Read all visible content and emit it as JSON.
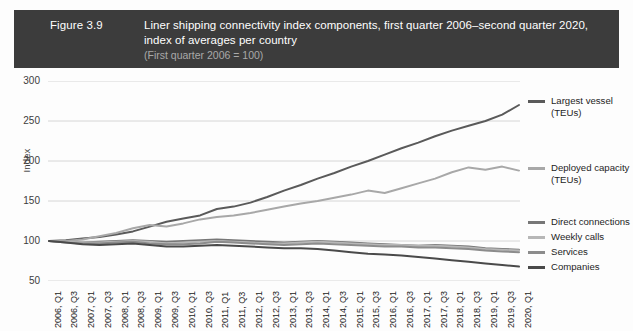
{
  "header": {
    "figure_number": "Figure 3.9",
    "title_line_1": "Liner shipping connectivity index components, first quarter 2006–second quarter 2020,",
    "title_line_2": "index of averages per country",
    "subtitle": "(First quarter 2006 = 100)",
    "background_color": "#3c3c3c",
    "title_color": "#ffffff",
    "subtitle_color": "#a9a9a9"
  },
  "chart_data": {
    "type": "line",
    "title": "Liner shipping connectivity index components, first quarter 2006–second quarter 2020, index of averages per country",
    "subtitle": "(First quarter 2006 = 100)",
    "xlabel": "",
    "ylabel": "Index",
    "ylim": [
      50,
      300
    ],
    "yticks": [
      50,
      100,
      150,
      200,
      250,
      300
    ],
    "grid": "horizontal",
    "legend_position": "right",
    "x": [
      "2006, Q1",
      "2006, Q3",
      "2007, Q1",
      "2007, Q3",
      "2008, Q1",
      "2008, Q3",
      "2009, Q1",
      "2009, Q3",
      "2010, Q1",
      "2010, Q3",
      "2011, Q1",
      "2011, Q3",
      "2012, Q1",
      "2012, Q3",
      "2013, Q1",
      "2013, Q3",
      "2014, Q1",
      "2014, Q3",
      "2015, Q1",
      "2015, Q3",
      "2016, Q1",
      "2016, Q3",
      "2017, Q1",
      "2017, Q3",
      "2018, Q1",
      "2018, Q3",
      "2019, Q1",
      "2019, Q3",
      "2020, Q1"
    ],
    "series": [
      {
        "name": "Largest vessel (TEUs)",
        "color": "#5a5a5a",
        "values": [
          100,
          101,
          103,
          105,
          108,
          112,
          118,
          124,
          128,
          132,
          140,
          143,
          148,
          155,
          163,
          170,
          178,
          185,
          193,
          200,
          208,
          216,
          223,
          231,
          238,
          244,
          250,
          258,
          270
        ]
      },
      {
        "name": "Deployed capacity (TEUs)",
        "color": "#a8a8a8",
        "values": [
          100,
          100,
          102,
          106,
          110,
          116,
          120,
          118,
          122,
          127,
          130,
          132,
          135,
          139,
          143,
          147,
          150,
          154,
          158,
          163,
          160,
          166,
          172,
          178,
          186,
          192,
          189,
          193,
          188
        ]
      },
      {
        "name": "Direct connections",
        "color": "#777777",
        "values": [
          100,
          99,
          98,
          99,
          100,
          101,
          100,
          99,
          100,
          101,
          102,
          101,
          100,
          99,
          98,
          99,
          100,
          99,
          98,
          97,
          96,
          95,
          94,
          95,
          94,
          93,
          91,
          90,
          89
        ]
      },
      {
        "name": "Weekly calls",
        "color": "#b7b7b7",
        "values": [
          100,
          99,
          98,
          98,
          99,
          100,
          99,
          97,
          98,
          99,
          100,
          99,
          98,
          97,
          97,
          98,
          99,
          98,
          97,
          96,
          95,
          95,
          94,
          94,
          93,
          92,
          90,
          89,
          88
        ]
      },
      {
        "name": "Services",
        "color": "#8c8c8c",
        "values": [
          100,
          98,
          97,
          97,
          98,
          99,
          97,
          96,
          96,
          97,
          99,
          98,
          97,
          96,
          95,
          96,
          97,
          96,
          95,
          94,
          93,
          93,
          92,
          92,
          91,
          90,
          88,
          87,
          86
        ]
      },
      {
        "name": "Companies",
        "color": "#4a4a4a",
        "values": [
          100,
          98,
          96,
          95,
          96,
          97,
          95,
          93,
          93,
          94,
          95,
          94,
          93,
          92,
          91,
          91,
          90,
          88,
          86,
          84,
          83,
          82,
          80,
          78,
          76,
          74,
          72,
          70,
          68
        ]
      }
    ]
  },
  "legend": [
    {
      "label": "Largest vessel\n(TEUs)",
      "color": "#5a5a5a"
    },
    {
      "label": "Deployed capacity\n(TEUs)",
      "color": "#a8a8a8"
    },
    {
      "label": "Direct connections",
      "color": "#777777"
    },
    {
      "label": "Weekly calls",
      "color": "#b7b7b7"
    },
    {
      "label": "Services",
      "color": "#8c8c8c"
    },
    {
      "label": "Companies",
      "color": "#4a4a4a"
    }
  ]
}
